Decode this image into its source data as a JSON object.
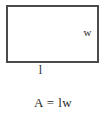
{
  "figure": {
    "type": "rectangle-area-diagram",
    "shape_name": "rectangle",
    "labels": {
      "width": "w",
      "length": "l"
    },
    "formula": "A = lw",
    "colors": {
      "background": "#ffffff",
      "stroke": "#4a4a4a",
      "text": "#2b2b2b"
    },
    "geometry": {
      "rect_left": 6,
      "rect_top": 5,
      "rect_width": 93,
      "rect_height": 58,
      "stroke_width": 2
    }
  }
}
